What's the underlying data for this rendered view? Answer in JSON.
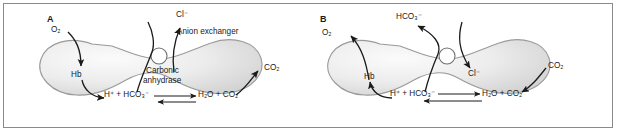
{
  "figure": {
    "type": "two-panel-diagram",
    "width": 617,
    "height": 132,
    "border_color": "#8a8a8a",
    "background": "#ffffff",
    "cell_fill_light": "#f2f2f2",
    "cell_fill_mid": "#dedede",
    "cell_outline": "#9a9a9a",
    "ink": "#1a1a1a"
  },
  "panel_a": {
    "label": "A",
    "description": "Systemic tissue capillary: oxygen enters, carbon dioxide leaves, bicarbonate exits in exchange for chloride entering",
    "labels": {
      "oxygen": "O₂",
      "hemoglobin": "Hb",
      "chloride": "Cl⁻",
      "anion_exchanger": "Anion exchanger",
      "carbonic_anhydrase_line1": "Carbonic",
      "carbonic_anhydrase_line2": "anhydrase",
      "left_reactants": "H⁺ + HCO₃⁻",
      "right_reactants": "H₂O + CO₂",
      "carbon_dioxide": "CO₂"
    },
    "reaction": {
      "left": "H+ + HCO3-",
      "right": "H2O + CO2",
      "enzyme": "Carbonic anhydrase",
      "dominant_direction": "right-to-left"
    },
    "flows": [
      {
        "species": "O₂",
        "direction": "into-cell",
        "binds": "Hb"
      },
      {
        "species": "Cl⁻",
        "direction": "out-of-cell",
        "via": "anion exchanger"
      },
      {
        "species": "HCO₃⁻",
        "direction": "out-of-cell",
        "via": "anion exchanger"
      },
      {
        "species": "CO₂",
        "direction": "out-of-cell"
      }
    ]
  },
  "panel_b": {
    "label": "B",
    "description": "Pulmonary capillary: carbon dioxide enters, oxygen leaves, chloride exits in exchange for bicarbonate entering",
    "labels": {
      "oxygen": "O₂",
      "hemoglobin": "Hb",
      "bicarbonate": "HCO₃⁻",
      "chloride": "Cl⁻",
      "left_reactants": "H⁺ + HCO₃⁻",
      "right_reactants": "H₂O + CO₂",
      "carbon_dioxide": "CO₂"
    },
    "reaction": {
      "left": "H+ + HCO3-",
      "right": "H2O + CO2",
      "dominant_direction": "right-to-left"
    },
    "flows": [
      {
        "species": "CO₂",
        "direction": "into-cell"
      },
      {
        "species": "Cl⁻",
        "direction": "into-cell",
        "via": "anion exchanger"
      },
      {
        "species": "HCO₃⁻",
        "direction": "out-of-cell",
        "via": "anion exchanger"
      },
      {
        "species": "O₂",
        "direction": "out-of-cell",
        "from": "Hb"
      }
    ]
  }
}
